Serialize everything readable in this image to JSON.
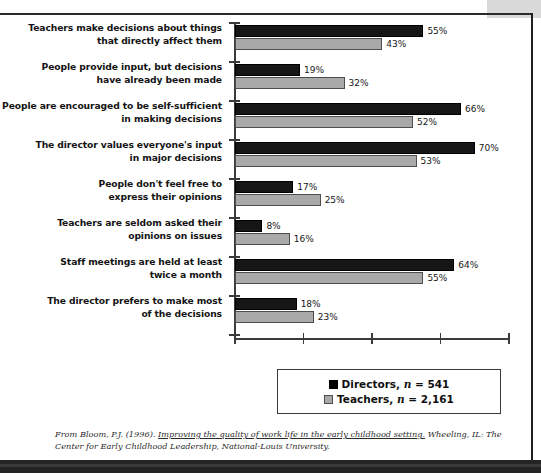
{
  "chart_data": {
    "type": "bar",
    "orientation": "horizontal",
    "title": "",
    "subtitle": "",
    "xlabel": "",
    "ylabel": "",
    "xlim": [
      0,
      80
    ],
    "xticks": [
      0,
      20,
      40,
      60,
      80
    ],
    "xtick_labels": [
      "",
      "",
      "",
      "",
      ""
    ],
    "grid": false,
    "legend_position": "bottom-center",
    "value_suffix": "%",
    "categories": [
      "Teachers make decisions about things that directly affect them",
      "People provide input, but decisions have already been made",
      "People are encouraged to be self-sufficient in making decisions",
      "The director values everyone's input in major decisions",
      "People don't feel free to express their opinions",
      "Teachers are seldom asked their opinions on issues",
      "Staff meetings are held at least twice a month",
      "The director prefers to make most of the decisions"
    ],
    "category_lines": [
      [
        "Teachers make decisions about things",
        "that directly affect them"
      ],
      [
        "People provide input, but decisions",
        "have already been made"
      ],
      [
        "People are encouraged to be self-sufficient",
        "in making decisions"
      ],
      [
        "The director values everyone's input",
        "in major decisions"
      ],
      [
        "People don't feel free to",
        "express their opinions"
      ],
      [
        "Teachers are seldom asked their",
        "opinions on issues"
      ],
      [
        "Staff meetings are held at least",
        "twice a month"
      ],
      [
        "The director prefers to make most",
        "of the decisions"
      ]
    ],
    "series": [
      {
        "name": "Directors",
        "n": "541",
        "color": "#161616",
        "values": [
          55,
          19,
          66,
          70,
          17,
          8,
          64,
          18
        ],
        "value_labels": [
          "55%",
          "19%",
          "66%",
          "70%",
          "17%",
          "8%",
          "64%",
          "18%"
        ]
      },
      {
        "name": "Teachers",
        "n": "2,161",
        "color": "#a9a9a9",
        "values": [
          43,
          32,
          52,
          53,
          25,
          16,
          55,
          23
        ],
        "value_labels": [
          "43%",
          "32%",
          "52%",
          "53%",
          "25%",
          "16%",
          "55%",
          "23%"
        ]
      }
    ]
  },
  "legend": {
    "items": [
      {
        "label_prefix": "Directors, ",
        "n_symbol": "n",
        "label_suffix": " = 541",
        "swatch": "dir"
      },
      {
        "label_prefix": "Teachers, ",
        "n_symbol": "n",
        "label_suffix": " = 2,161",
        "swatch": "tea"
      }
    ]
  },
  "citation": {
    "lead": "From Bloom, P.J. (1996).",
    "work_title": "Improving the quality of work life in the early childhood setting.",
    "publisher_city": "Wheeling, IL:",
    "publisher": "The Center for Early Childhood Leadership, National-Louis University."
  }
}
